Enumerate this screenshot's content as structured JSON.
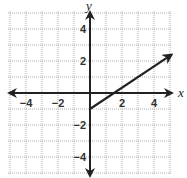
{
  "chart_data": {
    "type": "line",
    "title": "",
    "xlabel": "x",
    "ylabel": "y",
    "xlim": [
      -5,
      5
    ],
    "ylim": [
      -5,
      5
    ],
    "grid": true,
    "grid_step": 1,
    "x_ticks": [
      {
        "value": -4,
        "label": "−4"
      },
      {
        "value": -2,
        "label": "−2"
      },
      {
        "value": 2,
        "label": "2"
      },
      {
        "value": 4,
        "label": "4"
      }
    ],
    "y_ticks": [
      {
        "value": 4,
        "label": "4"
      },
      {
        "value": 2,
        "label": "2"
      },
      {
        "value": -2,
        "label": "−2"
      },
      {
        "value": -4,
        "label": "−4"
      }
    ],
    "series": [
      {
        "name": "y = (2/3)x - 1",
        "equation": "y = (2/3)x - 1",
        "start": {
          "x": 0,
          "y": -1,
          "endpoint": "closed"
        },
        "end": {
          "x": 5.1,
          "y": 2.4,
          "arrow": true
        },
        "x": [
          0,
          1.5,
          3,
          5.1
        ],
        "y": [
          -1,
          0,
          1,
          2.4
        ]
      }
    ],
    "colors": {
      "line": "#222222",
      "axis": "#222222",
      "grid": "#9a9a9a"
    }
  }
}
